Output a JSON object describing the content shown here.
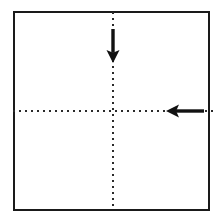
{
  "figure": {
    "title": "Square paper fold diagram",
    "description": "A square sheet outline with dotted horizontal and vertical center fold lines, a downward arrow on the upper vertical fold line and a leftward arrow on the right horizontal fold line.",
    "background_color": "#ffffff"
  },
  "canvas": {
    "width": 220,
    "height": 223
  },
  "paper": {
    "label": "square-paper-outline",
    "x": 14,
    "y": 12,
    "width": 195,
    "height": 198,
    "stroke_color": "#1a1a1a",
    "stroke_width": 2.2,
    "fill_color": "#ffffff"
  },
  "fold_lines": [
    {
      "name": "vertical-center-fold",
      "orientation": "vertical",
      "x1": 113,
      "y1": 12,
      "x2": 113,
      "y2": 210,
      "stroke_color": "#2a2a2a",
      "stroke_width": 2.1,
      "dash": "2 4",
      "style": "dotted"
    },
    {
      "name": "horizontal-center-fold",
      "orientation": "horizontal",
      "x1": 13,
      "y1": 111,
      "x2": 213,
      "y2": 111,
      "stroke_color": "#2a2a2a",
      "stroke_width": 2.1,
      "dash": "2 4",
      "style": "dotted"
    }
  ],
  "arrows": [
    {
      "name": "fold-arrow-down",
      "direction": "down",
      "tail_x": 113,
      "tail_y": 29,
      "tip_x": 113,
      "tip_y": 63,
      "shaft_width": 3.4,
      "head_width": 13,
      "head_length": 13,
      "color": "#111111"
    },
    {
      "name": "fold-arrow-left",
      "direction": "left",
      "tail_x": 204,
      "tail_y": 111,
      "tip_x": 166,
      "tip_y": 111,
      "shaft_width": 3.4,
      "head_width": 13,
      "head_length": 13,
      "color": "#111111"
    }
  ],
  "colors": {
    "outline": "#1a1a1a",
    "fold_line": "#2a2a2a",
    "arrow": "#111111",
    "paper_fill": "#ffffff"
  }
}
